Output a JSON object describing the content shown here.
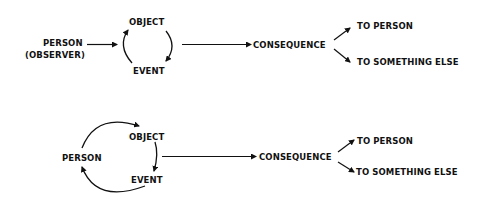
{
  "diagram_top": {
    "person": "PERSON",
    "observer": "(OBSERVER)",
    "object": "OBJECT",
    "event": "EVENT",
    "consequence": "CONSEQUENCE",
    "to_person": "TO PERSON",
    "to_something_else": "TO SOMETHING ELSE"
  },
  "diagram_bottom": {
    "person": "PERSON",
    "object": "OBJECT",
    "event": "EVENT",
    "consequence": "CONSEQUENCE",
    "to_person": "TO PERSON",
    "to_something_else": "TO SOMETHING ELSE"
  },
  "colors": {
    "ink": "#111111",
    "background": "#ffffff"
  }
}
